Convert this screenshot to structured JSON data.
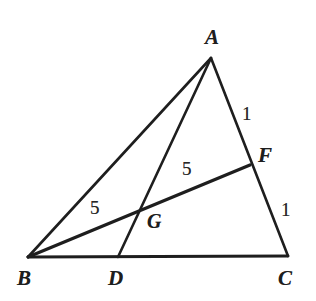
{
  "figure": {
    "kind": "triangle-with-cevians",
    "background_color": "#ffffff",
    "stroke_color": "#1a1a1a",
    "canvas": {
      "width": 316,
      "height": 301
    },
    "vertices": [
      {
        "id": "A",
        "label": "A",
        "x": 211,
        "y": 58,
        "label_x": 205,
        "label_y": 27
      },
      {
        "id": "B",
        "label": "B",
        "x": 28,
        "y": 257,
        "label_x": 17,
        "label_y": 268
      },
      {
        "id": "C",
        "label": "C",
        "x": 288,
        "y": 256,
        "label_x": 278,
        "label_y": 268
      }
    ],
    "points": [
      {
        "id": "D",
        "label": "D",
        "x": 118,
        "y": 257,
        "label_x": 108,
        "label_y": 268,
        "on_segment": "BC"
      },
      {
        "id": "F",
        "label": "F",
        "x": 250,
        "y": 165,
        "label_x": 258,
        "label_y": 145,
        "on_segment": "AC"
      },
      {
        "id": "G",
        "label": "G",
        "x": 140,
        "y": 210,
        "label_x": 147,
        "label_y": 211,
        "on_segment": "AD and BF intersection"
      }
    ],
    "segments": [
      {
        "id": "AB",
        "from": "A",
        "to": "B",
        "width": 2.6
      },
      {
        "id": "AC",
        "from": "A",
        "to": "C",
        "width": 2.6
      },
      {
        "id": "BC",
        "from": "B",
        "to": "C",
        "width": 2.8
      },
      {
        "id": "AD",
        "from": "A",
        "to": "D",
        "width": 2.6
      },
      {
        "id": "BF",
        "from": "B",
        "to": "F",
        "width": 3.2
      }
    ],
    "measures": [
      {
        "id": "BG",
        "text": "5",
        "segment": "BG",
        "x": 90,
        "y": 198
      },
      {
        "id": "GF",
        "text": "5",
        "segment": "GF",
        "x": 182,
        "y": 159
      },
      {
        "id": "AF",
        "text": "1",
        "segment": "AF",
        "x": 242,
        "y": 104
      },
      {
        "id": "FC",
        "text": "1",
        "segment": "FC",
        "x": 281,
        "y": 200
      }
    ]
  }
}
